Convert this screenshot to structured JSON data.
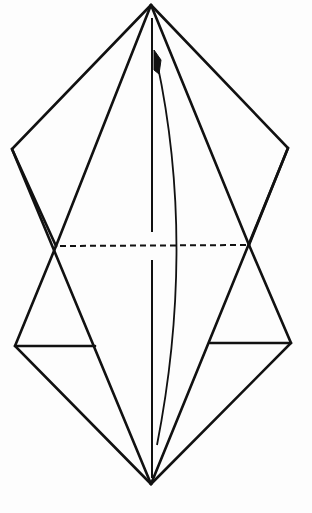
{
  "diagram": {
    "type": "origami-fold-diagram",
    "colors": {
      "background": "#fdfdfd",
      "line": "#111111"
    },
    "points": {
      "top_apex": [
        151,
        5
      ],
      "bottom_apex": [
        151,
        484
      ],
      "upper_left": [
        12,
        149
      ],
      "upper_right": [
        288,
        148
      ],
      "lower_left": [
        15,
        346
      ],
      "lower_right": [
        291,
        343
      ],
      "left_cross": [
        56,
        246
      ],
      "right_cross": [
        249,
        245
      ],
      "left_flap_inner": [
        95,
        346
      ],
      "right_flap_inner": [
        210,
        343
      ]
    },
    "valley_fold_horizontal": {
      "from": [
        60,
        246
      ],
      "to": [
        246,
        245
      ]
    },
    "center_line": {
      "x": 152,
      "top": 18,
      "bottom": 478,
      "gap_top": 232,
      "gap_bottom": 260
    },
    "arrow": {
      "kind": "curved-fold-arrow",
      "start": [
        157,
        445
      ],
      "control": [
        192,
        245
      ],
      "end": [
        156,
        58
      ],
      "head_at": "top"
    }
  }
}
